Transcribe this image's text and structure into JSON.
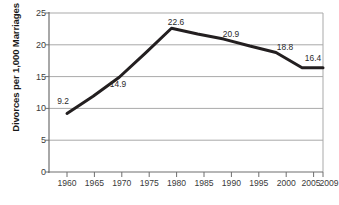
{
  "chart_data": {
    "type": "line",
    "title": "",
    "xlabel": "",
    "ylabel": "Divorces per 1,000 Marriages",
    "categories": [
      "1960",
      "1965",
      "1970",
      "1975",
      "1980",
      "1985",
      "1990",
      "1995",
      "2000",
      "2005",
      "2009"
    ],
    "x": [
      1960,
      1965,
      1970,
      1975,
      1980,
      1985,
      1990,
      1995,
      2000,
      2005,
      2009
    ],
    "values": [
      9.2,
      11.9,
      14.9,
      18.7,
      22.6,
      21.7,
      20.9,
      19.8,
      18.8,
      16.4,
      16.4
    ],
    "point_labels": [
      {
        "x": 1960,
        "value": 9.2,
        "text": "9.2"
      },
      {
        "x": 1970,
        "value": 14.9,
        "text": "14.9"
      },
      {
        "x": 1980,
        "value": 22.6,
        "text": "22.6"
      },
      {
        "x": 1990,
        "value": 20.9,
        "text": "20.9"
      },
      {
        "x": 2000,
        "value": 18.8,
        "text": "18.8"
      },
      {
        "x": 2009,
        "value": 16.4,
        "text": "16.4"
      }
    ],
    "ylim": [
      0,
      25
    ],
    "yticks": [
      0,
      5,
      10,
      15,
      20,
      25
    ],
    "ytick_labels": [
      "0",
      "5",
      "10",
      "15",
      "20",
      "25"
    ],
    "grid": true,
    "grid_axis": "y",
    "legend": false,
    "series_color": "#231f20",
    "grid_color": "#a9a9a9",
    "axis_color": "#808080"
  },
  "axes": {
    "x_tick_labels": [
      "1960",
      "1965",
      "1970",
      "1975",
      "1980",
      "1985",
      "1990",
      "1995",
      "2000",
      "2005",
      "2009"
    ],
    "y_tick_labels": [
      "25",
      "20",
      "15",
      "10",
      "5",
      "0"
    ],
    "y_axis_title": "Divorces per 1,000 Marriages"
  },
  "data_labels": [
    "9.2",
    "14.9",
    "22.6",
    "20.9",
    "18.8",
    "16.4"
  ]
}
